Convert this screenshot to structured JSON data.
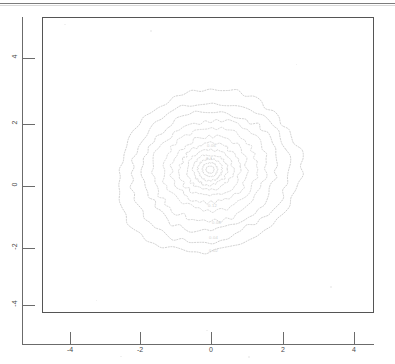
{
  "figure": {
    "kind": "contour-plot",
    "background_color": "#ffffff",
    "frame_color": "#555555",
    "axis_color": "#6b6b6b",
    "contour_color": "#bdbdbd",
    "contour_label_color": "#cfcfcf",
    "page_rule_color": "#7c7c7c"
  },
  "axes": {
    "x": {
      "ticks": [
        "-4",
        "-2",
        "0",
        "2",
        "4"
      ],
      "tick_values": [
        -4,
        -2,
        0,
        2,
        4
      ],
      "tick_px": [
        70,
        140,
        211,
        283,
        354
      ],
      "range": [
        -5.1,
        5.1
      ],
      "label": ""
    },
    "y": {
      "ticks": [
        "4",
        "2",
        "0",
        "-2",
        "-4"
      ],
      "tick_values": [
        4,
        2,
        0,
        -2,
        -4
      ],
      "tick_px": [
        58,
        124,
        186,
        248,
        305
      ],
      "range": [
        -4.6,
        4.9
      ],
      "label": "",
      "rotated": "90"
    }
  },
  "chart_data": {
    "type": "contour",
    "title": "",
    "subtitle": "",
    "xlabel": "",
    "ylabel": "",
    "xlim": [
      -5.1,
      5.1
    ],
    "ylim": [
      -4.6,
      4.9
    ],
    "xticks": [
      -4,
      -2,
      0,
      2,
      4
    ],
    "yticks": [
      -4,
      -2,
      0,
      2,
      4
    ],
    "grid": "off",
    "legend": "none",
    "linestyle": "dashed",
    "center": [
      0.0,
      0.0
    ],
    "peak_location": [
      0.05,
      -0.02
    ],
    "levels": [
      0.02,
      0.04,
      0.06,
      0.08,
      0.1,
      0.12,
      0.14,
      0.16,
      0.18,
      0.2,
      0.22,
      0.24
    ],
    "labeled_levels": [
      "0.02",
      "0.04",
      "0.06",
      "0.08",
      "0.1",
      "0.12"
    ],
    "contour_labels": [
      {
        "text": "0.06",
        "x_px": 207,
        "y_px": 143
      },
      {
        "text": "0.1",
        "x_px": 206,
        "y_px": 156
      },
      {
        "text": "0.12",
        "x_px": 208,
        "y_px": 203
      },
      {
        "text": "0.08",
        "x_px": 212,
        "y_px": 220
      },
      {
        "text": "0.04",
        "x_px": 209,
        "y_px": 235
      },
      {
        "text": "0.02",
        "x_px": 209,
        "y_px": 248
      }
    ],
    "rings": [
      {
        "level": 0.02,
        "rx": 93,
        "ry": 80,
        "cx": 0,
        "cy": 2,
        "rot": -18
      },
      {
        "level": 0.04,
        "rx": 80,
        "ry": 69,
        "cx": 1,
        "cy": 2,
        "rot": -16
      },
      {
        "level": 0.06,
        "rx": 68,
        "ry": 59,
        "cx": 2,
        "cy": 1,
        "rot": -14
      },
      {
        "level": 0.08,
        "rx": 57,
        "ry": 50,
        "cx": 2,
        "cy": 1,
        "rot": -12
      },
      {
        "level": 0.1,
        "rx": 47,
        "ry": 41,
        "cx": 2,
        "cy": 0,
        "rot": -10
      },
      {
        "level": 0.12,
        "rx": 38,
        "ry": 33,
        "cx": 2,
        "cy": 0,
        "rot": -8
      },
      {
        "level": 0.14,
        "rx": 30,
        "ry": 26,
        "cx": 2,
        "cy": 0,
        "rot": -6
      },
      {
        "level": 0.16,
        "rx": 23,
        "ry": 20,
        "cx": 2,
        "cy": 0,
        "rot": -4
      },
      {
        "level": 0.18,
        "rx": 17,
        "ry": 15,
        "cx": 2,
        "cy": 0,
        "rot": -2
      },
      {
        "level": 0.2,
        "rx": 12,
        "ry": 11,
        "cx": 2,
        "cy": 0,
        "rot": 0
      },
      {
        "level": 0.22,
        "rx": 7.5,
        "ry": 7,
        "cx": 2,
        "cy": 0,
        "rot": 0
      },
      {
        "level": 0.24,
        "rx": 4,
        "ry": 3.5,
        "cx": 2,
        "cy": 0,
        "rot": 0
      }
    ]
  }
}
